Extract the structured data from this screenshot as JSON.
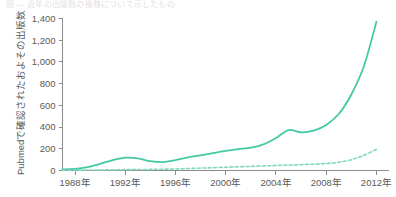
{
  "caption": {
    "clipped_text": "図 ― 近年の出版数の推移について示したもの"
  },
  "chart_data": {
    "type": "line",
    "title": "",
    "xlabel": "",
    "ylabel": "Pubmedで確認されたおよその出版数",
    "xlim": [
      1987,
      2013
    ],
    "ylim": [
      0,
      1400
    ],
    "grid": false,
    "legend": "none",
    "ytick_labels": [
      "0",
      "200",
      "400",
      "600",
      "800",
      "1,000",
      "1,200",
      "1,400"
    ],
    "ytick_values": [
      0,
      200,
      400,
      600,
      800,
      1000,
      1200,
      1400
    ],
    "xtick_labels": [
      "1988年",
      "1992年",
      "1996年",
      "2000年",
      "2004年",
      "2008年",
      "2012年"
    ],
    "xtick_values": [
      1988,
      1992,
      1996,
      2000,
      2004,
      2008,
      2012
    ],
    "x": [
      1987,
      1988,
      1989,
      1990,
      1991,
      1992,
      1993,
      1994,
      1995,
      1996,
      1997,
      1998,
      1999,
      2000,
      2001,
      2002,
      2003,
      2004,
      2005,
      2006,
      2007,
      2008,
      2009,
      2010,
      2011,
      2012
    ],
    "series": [
      {
        "name": "solid-series",
        "style": "solid",
        "color": "#45C9A5",
        "values": [
          10,
          14,
          30,
          62,
          95,
          118,
          112,
          86,
          78,
          96,
          120,
          140,
          160,
          180,
          196,
          210,
          240,
          300,
          372,
          352,
          368,
          420,
          520,
          700,
          960,
          1370
        ]
      },
      {
        "name": "dashed-series",
        "style": "dashed",
        "color": "#7FD9BE",
        "values": [
          2,
          3,
          4,
          5,
          6,
          8,
          9,
          10,
          12,
          14,
          18,
          22,
          26,
          30,
          34,
          38,
          42,
          46,
          50,
          54,
          58,
          64,
          76,
          100,
          140,
          195
        ]
      }
    ]
  }
}
